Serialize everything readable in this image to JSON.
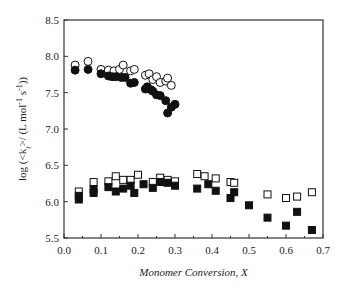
{
  "chart_data": {
    "type": "scatter",
    "title": "",
    "xlabel": "Monomer Conversion, X",
    "ylabel": "log (<k_t>/ (L mol^-1 s^-1))",
    "xlim": [
      0.0,
      0.7
    ],
    "ylim": [
      5.5,
      8.5
    ],
    "xticks": [
      "0.0",
      "0.1",
      "0.2",
      "0.3",
      "0.4",
      "0.5",
      "0.6",
      "0.7"
    ],
    "yticks": [
      "5.5",
      "6.0",
      "6.5",
      "7.0",
      "7.5",
      "8.0",
      "8.5"
    ],
    "grid": false,
    "legend": null,
    "series": [
      {
        "name": "open circles",
        "marker": "circle-open",
        "x": [
          0.03,
          0.065,
          0.1,
          0.12,
          0.135,
          0.15,
          0.16,
          0.18,
          0.19,
          0.22,
          0.23,
          0.24,
          0.25,
          0.26,
          0.275,
          0.28,
          0.29
        ],
        "y": [
          7.88,
          7.93,
          7.82,
          7.81,
          7.8,
          7.82,
          7.88,
          7.8,
          7.82,
          7.74,
          7.76,
          7.68,
          7.72,
          7.64,
          7.66,
          7.7,
          7.6
        ]
      },
      {
        "name": "filled circles",
        "marker": "circle-filled",
        "x": [
          0.03,
          0.065,
          0.1,
          0.12,
          0.13,
          0.14,
          0.155,
          0.165,
          0.18,
          0.19,
          0.22,
          0.225,
          0.235,
          0.24,
          0.25,
          0.26,
          0.275,
          0.28,
          0.29,
          0.3
        ],
        "y": [
          7.81,
          7.82,
          7.76,
          7.73,
          7.72,
          7.72,
          7.71,
          7.71,
          7.63,
          7.64,
          7.55,
          7.58,
          7.54,
          7.52,
          7.47,
          7.46,
          7.39,
          7.22,
          7.3,
          7.34
        ]
      },
      {
        "name": "open squares",
        "marker": "square-open",
        "x": [
          0.04,
          0.08,
          0.12,
          0.14,
          0.16,
          0.18,
          0.2,
          0.24,
          0.26,
          0.28,
          0.3,
          0.36,
          0.38,
          0.41,
          0.45,
          0.46,
          0.55,
          0.6,
          0.63,
          0.67
        ],
        "y": [
          6.14,
          6.27,
          6.28,
          6.35,
          6.3,
          6.3,
          6.37,
          6.27,
          6.33,
          6.3,
          6.28,
          6.38,
          6.35,
          6.32,
          6.27,
          6.26,
          6.1,
          6.05,
          6.07,
          6.13
        ]
      },
      {
        "name": "filled squares",
        "marker": "square-filled",
        "x": [
          0.04,
          0.04,
          0.08,
          0.08,
          0.12,
          0.14,
          0.16,
          0.18,
          0.19,
          0.215,
          0.24,
          0.26,
          0.28,
          0.3,
          0.36,
          0.39,
          0.41,
          0.45,
          0.46,
          0.5,
          0.55,
          0.6,
          0.63,
          0.67
        ],
        "y": [
          6.03,
          6.08,
          6.12,
          6.17,
          6.2,
          6.14,
          6.18,
          6.22,
          6.12,
          6.24,
          6.19,
          6.27,
          6.26,
          6.22,
          6.18,
          6.24,
          6.15,
          6.05,
          6.13,
          5.95,
          5.78,
          5.67,
          5.86,
          5.61
        ]
      }
    ]
  },
  "axes": {
    "xlabel": "Monomer Conversion, X",
    "ylabel_prefix": "log (<k",
    "ylabel_sub": "t",
    "ylabel_suffix": ">/ (L mol",
    "ylabel_sup1": "-1",
    "ylabel_mid": " s",
    "ylabel_sup2": "-1",
    "ylabel_end": "))"
  }
}
